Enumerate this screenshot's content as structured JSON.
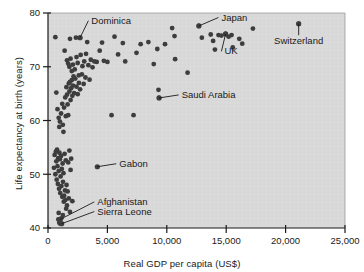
{
  "chart_data": {
    "type": "scatter",
    "title": "",
    "xlabel": "Real GDP per capita (US$)",
    "ylabel": "Life expectancy at birth (years)",
    "xlim": [
      0,
      25000
    ],
    "ylim": [
      40,
      80
    ],
    "xticks": [
      0,
      5000,
      10000,
      15000,
      20000,
      25000
    ],
    "xticklabels": [
      "0",
      "5,000",
      "10,000",
      "15,000",
      "20,000",
      "25,000"
    ],
    "yticks": [
      40,
      50,
      60,
      70,
      80
    ],
    "yticklabels": [
      "40",
      "50",
      "60",
      "70",
      "80"
    ],
    "grid": false,
    "legend": null,
    "marker": {
      "shape": "circle",
      "color": "#3d3d3d",
      "size": 2.4
    },
    "background_color": "#d9d9d9",
    "frame_color": "#1a1a1a",
    "points": [
      [
        620,
        75.5
      ],
      [
        1850,
        75.2
      ],
      [
        2350,
        75.4
      ],
      [
        2700,
        75.4
      ],
      [
        3300,
        74.6
      ],
      [
        4550,
        74.5
      ],
      [
        5600,
        75.6
      ],
      [
        6300,
        74.4
      ],
      [
        7450,
        72.6
      ],
      [
        8450,
        74.6
      ],
      [
        9200,
        73.3
      ],
      [
        9850,
        74.2
      ],
      [
        10450,
        77.2
      ],
      [
        10650,
        75.7
      ],
      [
        10700,
        71.4
      ],
      [
        11750,
        68.9
      ],
      [
        12700,
        77.6
      ],
      [
        12950,
        75.4
      ],
      [
        13700,
        76.0
      ],
      [
        13900,
        74.8
      ],
      [
        14050,
        73.2
      ],
      [
        14350,
        75.9
      ],
      [
        14600,
        75.8
      ],
      [
        14950,
        76.1
      ],
      [
        15200,
        75.6
      ],
      [
        15450,
        75.9
      ],
      [
        15550,
        73.6
      ],
      [
        16100,
        75.2
      ],
      [
        16350,
        74.3
      ],
      [
        17250,
        77.1
      ],
      [
        21100,
        78.0
      ],
      [
        1400,
        73.0
      ],
      [
        1600,
        71.2
      ],
      [
        1700,
        70.6
      ],
      [
        1800,
        70.0
      ],
      [
        1900,
        71.5
      ],
      [
        2000,
        69.2
      ],
      [
        2100,
        70.4
      ],
      [
        2250,
        69.5
      ],
      [
        2400,
        71.8
      ],
      [
        2500,
        70.7
      ],
      [
        2600,
        68.4
      ],
      [
        2750,
        72.2
      ],
      [
        2900,
        70.1
      ],
      [
        3050,
        71.0
      ],
      [
        3200,
        72.4
      ],
      [
        3400,
        70.3
      ],
      [
        3600,
        71.3
      ],
      [
        3750,
        69.9
      ],
      [
        3900,
        71.0
      ],
      [
        4100,
        70.9
      ],
      [
        4350,
        73.0
      ],
      [
        4700,
        71.1
      ],
      [
        5000,
        70.9
      ],
      [
        5350,
        61.0
      ],
      [
        5900,
        72.3
      ],
      [
        6500,
        71.0
      ],
      [
        7200,
        61.0
      ],
      [
        7800,
        74.2
      ],
      [
        8900,
        70.5
      ],
      [
        9300,
        65.7
      ],
      [
        9350,
        64.2
      ],
      [
        700,
        65.2
      ],
      [
        800,
        62.1
      ],
      [
        900,
        60.5
      ],
      [
        950,
        58.8
      ],
      [
        1000,
        59.8
      ],
      [
        1100,
        61.3
      ],
      [
        1200,
        63.1
      ],
      [
        1250,
        59.2
      ],
      [
        1300,
        57.9
      ],
      [
        1350,
        62.4
      ],
      [
        1450,
        64.3
      ],
      [
        1500,
        60.8
      ],
      [
        1550,
        66.2
      ],
      [
        1600,
        64.8
      ],
      [
        1650,
        63.0
      ],
      [
        1700,
        61.0
      ],
      [
        1750,
        66.9
      ],
      [
        1800,
        65.4
      ],
      [
        1850,
        67.2
      ],
      [
        1900,
        63.8
      ],
      [
        1950,
        66.0
      ],
      [
        2000,
        67.5
      ],
      [
        2050,
        64.6
      ],
      [
        2100,
        66.5
      ],
      [
        2150,
        68.2
      ],
      [
        2200,
        65.1
      ],
      [
        2300,
        67.8
      ],
      [
        2400,
        66.3
      ],
      [
        2500,
        64.9
      ],
      [
        2600,
        67.0
      ],
      [
        2700,
        65.8
      ],
      [
        2850,
        68.6
      ],
      [
        3000,
        66.8
      ],
      [
        3150,
        68.0
      ],
      [
        3500,
        67.6
      ],
      [
        500,
        51.2
      ],
      [
        560,
        53.6
      ],
      [
        620,
        50.0
      ],
      [
        660,
        54.2
      ],
      [
        700,
        52.4
      ],
      [
        730,
        49.0
      ],
      [
        760,
        54.6
      ],
      [
        800,
        51.5
      ],
      [
        830,
        48.2
      ],
      [
        860,
        53.0
      ],
      [
        900,
        50.6
      ],
      [
        930,
        47.3
      ],
      [
        960,
        54.0
      ],
      [
        1000,
        52.8
      ],
      [
        1030,
        46.5
      ],
      [
        1060,
        49.6
      ],
      [
        1100,
        53.4
      ],
      [
        1130,
        47.8
      ],
      [
        1160,
        51.0
      ],
      [
        1200,
        45.8
      ],
      [
        1230,
        52.0
      ],
      [
        1260,
        48.6
      ],
      [
        1300,
        50.2
      ],
      [
        1330,
        44.9
      ],
      [
        1360,
        46.0
      ],
      [
        1400,
        53.8
      ],
      [
        1430,
        47.0
      ],
      [
        1460,
        45.2
      ],
      [
        1500,
        52.6
      ],
      [
        1530,
        43.6
      ],
      [
        1560,
        48.0
      ],
      [
        1600,
        44.2
      ],
      [
        1650,
        46.8
      ],
      [
        1700,
        52.2
      ],
      [
        1750,
        45.5
      ],
      [
        1800,
        54.4
      ],
      [
        1850,
        43.0
      ],
      [
        1900,
        50.8
      ],
      [
        1950,
        52.9
      ],
      [
        2050,
        45.0
      ],
      [
        870,
        41.6
      ],
      [
        950,
        41.0
      ],
      [
        1020,
        40.8
      ],
      [
        1120,
        41.8
      ],
      [
        1250,
        42.4
      ],
      [
        900,
        42.8
      ]
    ],
    "annotations": [
      {
        "label": "Dominica",
        "point": [
          2700,
          75.4
        ],
        "text_x": 3650,
        "text_y": 78.0,
        "anchor": "start",
        "leader": true
      },
      {
        "label": "Japan",
        "point": [
          12700,
          77.6
        ],
        "text_x": 14600,
        "text_y": 78.6,
        "anchor": "start",
        "leader": true
      },
      {
        "label": "UK",
        "point": [
          14950,
          76.1
        ],
        "text_x": 14850,
        "text_y": 72.3,
        "anchor": "start",
        "leader": true
      },
      {
        "label": "Switzerland",
        "point": [
          21100,
          78.0
        ],
        "text_x": 21100,
        "text_y": 74.2,
        "anchor": "middle",
        "leader": true
      },
      {
        "label": "Saudi Arabia",
        "point": [
          9350,
          64.2
        ],
        "text_x": 11250,
        "text_y": 64.2,
        "anchor": "start",
        "leader": true
      },
      {
        "label": "Gabon",
        "point": [
          4150,
          51.4
        ],
        "text_x": 6000,
        "text_y": 51.4,
        "anchor": "start",
        "leader": true
      },
      {
        "label": "Afghanistan",
        "point": [
          1020,
          41.6
        ],
        "text_x": 4150,
        "text_y": 44.3,
        "anchor": "start",
        "leader": true
      },
      {
        "label": "Sierra Leone",
        "point": [
          1150,
          40.8
        ],
        "text_x": 4150,
        "text_y": 42.5,
        "anchor": "start",
        "leader": true
      }
    ]
  }
}
